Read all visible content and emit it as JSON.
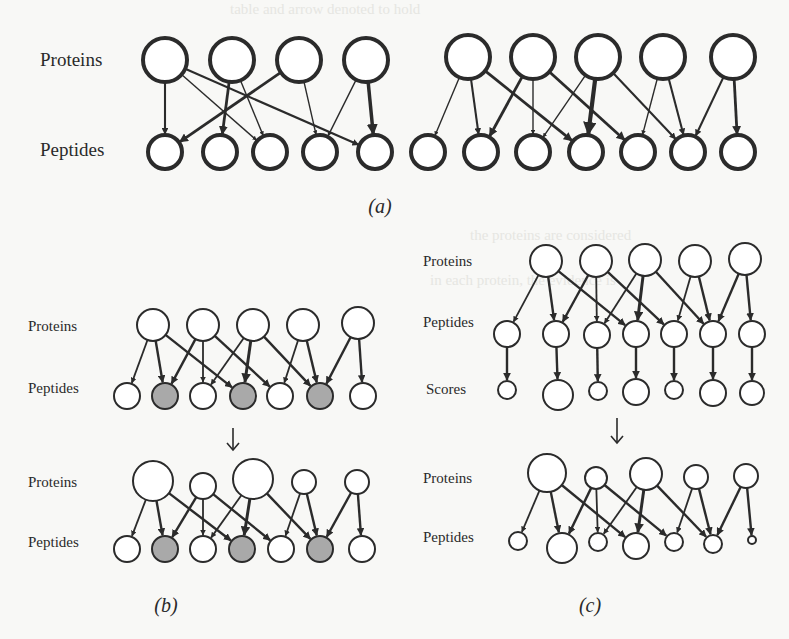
{
  "figure": {
    "colors": {
      "ink": "#2b2b2b",
      "shaded": "#a9a9a9",
      "background": "#f8f8f6",
      "node_fill": "#ffffff"
    },
    "panels": [
      {
        "id": "a",
        "caption": "(a)",
        "caption_pos": [
          380,
          213
        ],
        "caption_size": 20,
        "row_labels": [
          {
            "text": "Proteins",
            "x": 40,
            "y": 66,
            "size": 19
          },
          {
            "text": "Peptides",
            "x": 40,
            "y": 156,
            "size": 19
          }
        ],
        "stroke": 4,
        "graphs": [
          {
            "proteins": [
              {
                "x": 165,
                "y": 60,
                "r": 22
              },
              {
                "x": 232,
                "y": 60,
                "r": 22
              },
              {
                "x": 299,
                "y": 60,
                "r": 22
              },
              {
                "x": 366,
                "y": 60,
                "r": 22
              }
            ],
            "peptides": [
              {
                "x": 165,
                "y": 152,
                "r": 17
              },
              {
                "x": 220,
                "y": 152,
                "r": 17
              },
              {
                "x": 270,
                "y": 152,
                "r": 17
              },
              {
                "x": 320,
                "y": 152,
                "r": 17
              },
              {
                "x": 375,
                "y": 152,
                "r": 17
              }
            ],
            "edges": [
              [
                0,
                0,
                3
              ],
              [
                0,
                2,
                2
              ],
              [
                0,
                4,
                3
              ],
              [
                1,
                1,
                4
              ],
              [
                1,
                2,
                2
              ],
              [
                2,
                0,
                4
              ],
              [
                2,
                3,
                2
              ],
              [
                3,
                3,
                2
              ],
              [
                3,
                4,
                5
              ]
            ]
          },
          {
            "proteins": [
              {
                "x": 468,
                "y": 57,
                "r": 22
              },
              {
                "x": 533,
                "y": 57,
                "r": 22
              },
              {
                "x": 598,
                "y": 57,
                "r": 22
              },
              {
                "x": 663,
                "y": 57,
                "r": 22
              },
              {
                "x": 733,
                "y": 57,
                "r": 22
              }
            ],
            "peptides": [
              {
                "x": 428,
                "y": 152,
                "r": 17
              },
              {
                "x": 481,
                "y": 152,
                "r": 17
              },
              {
                "x": 533,
                "y": 152,
                "r": 17
              },
              {
                "x": 586,
                "y": 152,
                "r": 17
              },
              {
                "x": 638,
                "y": 152,
                "r": 17
              },
              {
                "x": 688,
                "y": 152,
                "r": 17
              },
              {
                "x": 738,
                "y": 152,
                "r": 17
              }
            ],
            "edges": [
              [
                0,
                0,
                2
              ],
              [
                0,
                1,
                3
              ],
              [
                0,
                3,
                4
              ],
              [
                1,
                1,
                4
              ],
              [
                1,
                2,
                2
              ],
              [
                1,
                4,
                4
              ],
              [
                2,
                2,
                2
              ],
              [
                2,
                3,
                6
              ],
              [
                2,
                5,
                3
              ],
              [
                3,
                4,
                2
              ],
              [
                3,
                5,
                3
              ],
              [
                4,
                5,
                3
              ],
              [
                4,
                6,
                4
              ]
            ]
          }
        ]
      },
      {
        "id": "b",
        "caption": "(b)",
        "caption_pos": [
          166,
          612
        ],
        "caption_size": 20,
        "row_labels": [
          {
            "text": "Proteins",
            "x": 28,
            "y": 331,
            "size": 15
          },
          {
            "text": "Peptides",
            "x": 28,
            "y": 393,
            "size": 15
          },
          {
            "text": "Proteins",
            "x": 28,
            "y": 487,
            "size": 15
          },
          {
            "text": "Peptides",
            "x": 28,
            "y": 547,
            "size": 15
          }
        ],
        "stroke": 2,
        "transition_arrow": {
          "x": 233,
          "y1": 428,
          "y2": 450
        },
        "graphs": [
          {
            "proteins": [
              {
                "x": 153,
                "y": 325,
                "r": 16
              },
              {
                "x": 203,
                "y": 325,
                "r": 16
              },
              {
                "x": 253,
                "y": 325,
                "r": 16
              },
              {
                "x": 303,
                "y": 325,
                "r": 16
              },
              {
                "x": 358,
                "y": 323,
                "r": 16
              }
            ],
            "peptides": [
              {
                "x": 127,
                "y": 396,
                "r": 13
              },
              {
                "x": 165,
                "y": 396,
                "r": 13,
                "shaded": true
              },
              {
                "x": 203,
                "y": 396,
                "r": 13
              },
              {
                "x": 243,
                "y": 396,
                "r": 13,
                "shaded": true
              },
              {
                "x": 280,
                "y": 396,
                "r": 13
              },
              {
                "x": 320,
                "y": 396,
                "r": 13,
                "shaded": true
              },
              {
                "x": 363,
                "y": 396,
                "r": 13
              }
            ],
            "edges": [
              [
                0,
                0,
                3
              ],
              [
                0,
                1,
                4
              ],
              [
                0,
                3,
                4
              ],
              [
                1,
                1,
                4
              ],
              [
                1,
                2,
                3
              ],
              [
                1,
                4,
                4
              ],
              [
                2,
                2,
                3
              ],
              [
                2,
                3,
                5
              ],
              [
                2,
                5,
                4
              ],
              [
                3,
                4,
                3
              ],
              [
                3,
                5,
                4
              ],
              [
                4,
                5,
                4
              ],
              [
                4,
                6,
                4
              ]
            ]
          },
          {
            "proteins": [
              {
                "x": 153,
                "y": 481,
                "r": 20
              },
              {
                "x": 203,
                "y": 486,
                "r": 13
              },
              {
                "x": 253,
                "y": 479,
                "r": 20
              },
              {
                "x": 304,
                "y": 482,
                "r": 12
              },
              {
                "x": 357,
                "y": 482,
                "r": 12
              }
            ],
            "peptides": [
              {
                "x": 127,
                "y": 549,
                "r": 13
              },
              {
                "x": 165,
                "y": 549,
                "r": 13,
                "shaded": true
              },
              {
                "x": 203,
                "y": 549,
                "r": 13
              },
              {
                "x": 242,
                "y": 549,
                "r": 13,
                "shaded": true
              },
              {
                "x": 281,
                "y": 549,
                "r": 13
              },
              {
                "x": 320,
                "y": 549,
                "r": 13,
                "shaded": true
              },
              {
                "x": 362,
                "y": 549,
                "r": 13
              }
            ],
            "edges": [
              [
                0,
                0,
                3
              ],
              [
                0,
                1,
                4
              ],
              [
                0,
                3,
                4
              ],
              [
                1,
                1,
                4
              ],
              [
                1,
                2,
                3
              ],
              [
                1,
                4,
                4
              ],
              [
                2,
                2,
                3
              ],
              [
                2,
                3,
                5
              ],
              [
                2,
                5,
                4
              ],
              [
                3,
                4,
                3
              ],
              [
                3,
                5,
                4
              ],
              [
                4,
                5,
                4
              ],
              [
                4,
                6,
                4
              ]
            ]
          }
        ]
      },
      {
        "id": "c",
        "caption": "(c)",
        "caption_pos": [
          590,
          612
        ],
        "caption_size": 20,
        "row_labels": [
          {
            "text": "Proteins",
            "x": 423,
            "y": 266,
            "size": 15
          },
          {
            "text": "Peptides",
            "x": 423,
            "y": 327,
            "size": 15
          },
          {
            "text": "Scores",
            "x": 426,
            "y": 394,
            "size": 15
          },
          {
            "text": "Proteins",
            "x": 423,
            "y": 483,
            "size": 15
          },
          {
            "text": "Peptides",
            "x": 423,
            "y": 542,
            "size": 15
          }
        ],
        "stroke": 2,
        "transition_arrow": {
          "x": 617,
          "y1": 418,
          "y2": 443
        },
        "graphs": [
          {
            "proteins": [
              {
                "x": 546,
                "y": 261,
                "r": 16
              },
              {
                "x": 596,
                "y": 261,
                "r": 16
              },
              {
                "x": 645,
                "y": 260,
                "r": 16
              },
              {
                "x": 695,
                "y": 261,
                "r": 16
              },
              {
                "x": 745,
                "y": 259,
                "r": 16
              }
            ],
            "peptides": [
              {
                "x": 507,
                "y": 334,
                "r": 13
              },
              {
                "x": 556,
                "y": 334,
                "r": 13
              },
              {
                "x": 597,
                "y": 335,
                "r": 13
              },
              {
                "x": 636,
                "y": 334,
                "r": 13
              },
              {
                "x": 674,
                "y": 334,
                "r": 13
              },
              {
                "x": 713,
                "y": 334,
                "r": 13
              },
              {
                "x": 752,
                "y": 334,
                "r": 13
              }
            ],
            "edges": [
              [
                0,
                0,
                3
              ],
              [
                0,
                1,
                4
              ],
              [
                0,
                3,
                4
              ],
              [
                1,
                1,
                4
              ],
              [
                1,
                2,
                3
              ],
              [
                1,
                4,
                4
              ],
              [
                2,
                2,
                3
              ],
              [
                2,
                3,
                5
              ],
              [
                2,
                5,
                4
              ],
              [
                3,
                4,
                3
              ],
              [
                3,
                5,
                4
              ],
              [
                4,
                5,
                4
              ],
              [
                4,
                6,
                4
              ]
            ],
            "scores": [
              {
                "x": 507,
                "y": 390,
                "r": 9
              },
              {
                "x": 558,
                "y": 395,
                "r": 15
              },
              {
                "x": 598,
                "y": 391,
                "r": 9
              },
              {
                "x": 636,
                "y": 392,
                "r": 13
              },
              {
                "x": 674,
                "y": 390,
                "r": 9
              },
              {
                "x": 713,
                "y": 393,
                "r": 13
              },
              {
                "x": 752,
                "y": 393,
                "r": 12
              }
            ]
          },
          {
            "proteins": [
              {
                "x": 547,
                "y": 473,
                "r": 19
              },
              {
                "x": 596,
                "y": 478,
                "r": 11
              },
              {
                "x": 646,
                "y": 474,
                "r": 16
              },
              {
                "x": 696,
                "y": 477,
                "r": 12
              },
              {
                "x": 746,
                "y": 476,
                "r": 12
              }
            ],
            "peptides": [
              {
                "x": 518,
                "y": 541,
                "r": 9
              },
              {
                "x": 562,
                "y": 548,
                "r": 15
              },
              {
                "x": 598,
                "y": 542,
                "r": 9
              },
              {
                "x": 636,
                "y": 546,
                "r": 13
              },
              {
                "x": 674,
                "y": 542,
                "r": 9
              },
              {
                "x": 713,
                "y": 544,
                "r": 9
              },
              {
                "x": 752,
                "y": 540,
                "r": 4
              }
            ],
            "edges": [
              [
                0,
                0,
                3
              ],
              [
                0,
                1,
                4
              ],
              [
                0,
                3,
                4
              ],
              [
                1,
                1,
                4
              ],
              [
                1,
                2,
                3
              ],
              [
                1,
                4,
                4
              ],
              [
                2,
                2,
                3
              ],
              [
                2,
                3,
                5
              ],
              [
                2,
                5,
                4
              ],
              [
                3,
                4,
                3
              ],
              [
                3,
                5,
                4
              ],
              [
                4,
                5,
                4
              ],
              [
                4,
                6,
                4
              ]
            ]
          }
        ]
      }
    ],
    "node_types": [
      "protein-node",
      "peptide-node",
      "score-node"
    ],
    "icons": {
      "transition_arrow": "down-arrow-icon"
    }
  }
}
